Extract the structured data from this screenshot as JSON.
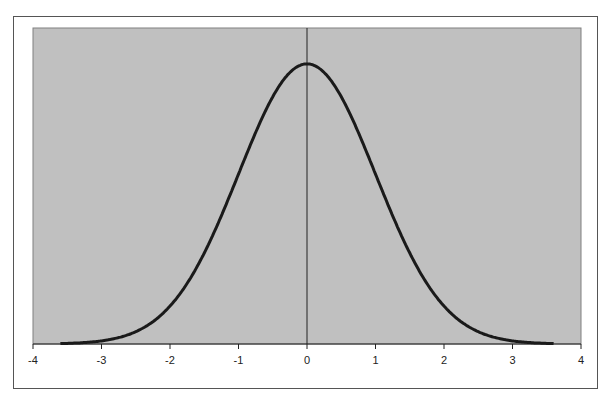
{
  "chart_data": {
    "type": "line",
    "title": "",
    "xlabel": "",
    "ylabel": "",
    "xlim": [
      -4,
      4
    ],
    "ylim": [
      0,
      0.45
    ],
    "x_ticks": [
      "-4",
      "-3",
      "-2",
      "-1",
      "0",
      "1",
      "2",
      "3",
      "4"
    ],
    "grid": false,
    "legend": null,
    "series": [
      {
        "name": "Standard normal density",
        "x": [
          -3.5,
          -3,
          -2.5,
          -2,
          -1.5,
          -1,
          -0.5,
          0,
          0.5,
          1,
          1.5,
          2,
          2.5,
          3,
          3.5
        ],
        "values": [
          0.0009,
          0.0044,
          0.0175,
          0.054,
          0.1295,
          0.242,
          0.3521,
          0.3989,
          0.3521,
          0.242,
          0.1295,
          0.054,
          0.0175,
          0.0044,
          0.0009
        ]
      }
    ],
    "colors": {
      "plot_background": "#c0c0c0",
      "line": "#1a1a1a",
      "frame": "#555555"
    }
  }
}
